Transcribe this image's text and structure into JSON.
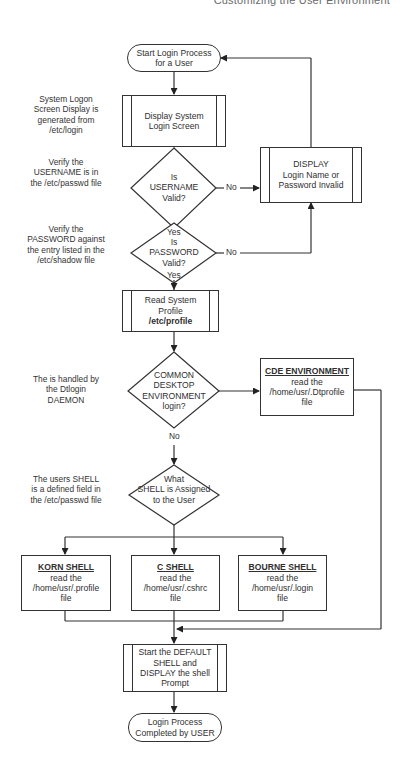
{
  "running_header": "Customizing the User Environment",
  "nodes": {
    "start": {
      "line1": "Start Login Process",
      "line2": "for a User"
    },
    "display_login": {
      "line1": "Display System",
      "line2": "Login Screen"
    },
    "username_check": {
      "line1": "Is",
      "line2": "USERNAME",
      "line3": "Valid?"
    },
    "password_check": {
      "line1": "Is",
      "line2": "PASSWORD",
      "line3": "Valid?"
    },
    "invalid_box": {
      "line1": "DISPLAY",
      "line2": "Login Name or",
      "line3": "Password Invalid"
    },
    "read_profile": {
      "line1": "Read System",
      "line2": "Profile",
      "line3": "/etc/profile"
    },
    "cde_check": {
      "line1": "COMMON",
      "line2": "DESKTOP",
      "line3": "ENVIRONMENT",
      "line4": "login?"
    },
    "cde_box": {
      "title": "CDE ENVIRONMENT",
      "line1": "read the",
      "line2": "/home/usr/.Dtprofile",
      "line3": "file"
    },
    "shell_check": {
      "line1": "What",
      "line2": "SHELL is Assigned",
      "line3": "to the User"
    },
    "korn": {
      "title": "KORN SHELL",
      "line1": "read the",
      "line2": "/home/usr/.profile",
      "line3": "file"
    },
    "cshell": {
      "title": "C SHELL",
      "line1": "read the",
      "line2": "/home/usr/.cshrc",
      "line3": "file"
    },
    "bourne": {
      "title": "BOURNE SHELL",
      "line1": "read the",
      "line2": "/home/usr/.login",
      "line3": "file"
    },
    "default_shell": {
      "line1": "Start the DEFAULT",
      "line2": "SHELL and",
      "line3": "DISPLAY the shell",
      "line4": "Prompt"
    },
    "end": {
      "line1": "Login Process",
      "line2": "Completed by USER"
    }
  },
  "edge_labels": {
    "username_no": "No",
    "username_yes": "Yes",
    "password_no": "No",
    "password_yes": "Yes",
    "cde_no": "No"
  },
  "notes": {
    "login_screen": [
      "System Logon",
      "Screen Display is",
      "generated from",
      "/etc/login"
    ],
    "username": [
      "Verify the",
      "USERNAME is in",
      "the /etc/passwd file"
    ],
    "password": [
      "Verify the",
      "PASSWORD against",
      "the entry listed in the",
      "/etc/shadow file"
    ],
    "cde": [
      "The is handled by",
      "the Dtlogin",
      "DAEMON"
    ],
    "shell": [
      "The users SHELL",
      "is a defined field in",
      "the /etc/passwd file"
    ]
  }
}
